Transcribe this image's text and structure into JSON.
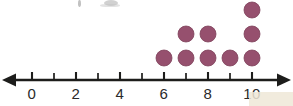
{
  "chart_data": {
    "type": "bar",
    "plot_style": "dot-plot",
    "title": "",
    "xlabel": "",
    "ylabel": "",
    "categories": [
      0,
      1,
      2,
      3,
      4,
      5,
      6,
      7,
      8,
      9,
      10
    ],
    "values": [
      0,
      0,
      0,
      0,
      0,
      0,
      1,
      2,
      2,
      1,
      3
    ],
    "total_dots": 9,
    "axis": {
      "min": 0,
      "max": 10,
      "tick_step": 1,
      "label_step": 2,
      "tick_labels": [
        "0",
        "2",
        "4",
        "6",
        "8",
        "10"
      ],
      "labeled_values": [
        0,
        2,
        4,
        6,
        8,
        10
      ],
      "left_arrow": true,
      "right_arrow": true,
      "grid": false
    },
    "legend": {
      "position": "none",
      "entries": []
    },
    "annotations": []
  },
  "style": {
    "dot_color": "#96506e",
    "dot_edge_color": "#7d4059",
    "axis_color": "#1d1d1b",
    "label_color": "#2a2a2a",
    "background": "#ffffff",
    "corner_patch_color": "#efe7d7"
  },
  "geometry": {
    "axis_y": 80,
    "x_start": 32,
    "x_step": 22,
    "dot_diameter": 16,
    "row_step": 24,
    "first_row_center_y": 58
  }
}
